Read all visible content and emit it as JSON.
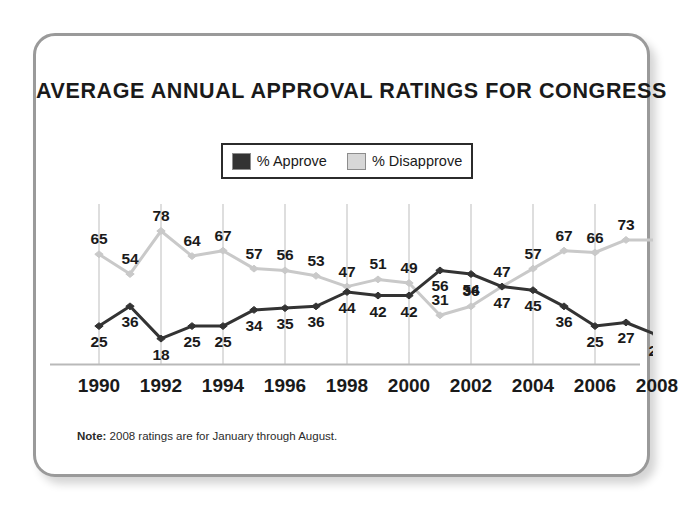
{
  "title": "AVERAGE ANNUAL APPROVAL RATINGS FOR CONGRESS",
  "legend": {
    "approve_label": "% Approve",
    "disapprove_label": "% Disapprove",
    "approve_color": "#333333",
    "disapprove_color": "#c9c9c9"
  },
  "note": {
    "prefix": "Note:",
    "text": " 2008 ratings are for January through August."
  },
  "chart_data": {
    "type": "line",
    "title": "AVERAGE ANNUAL APPROVAL RATINGS FOR CONGRESS",
    "xlabel": "",
    "ylabel": "",
    "ylim": [
      10,
      85
    ],
    "grid": "vertical-only",
    "legend_position": "top-center",
    "x": [
      1990,
      1991,
      1992,
      1993,
      1994,
      1995,
      1996,
      1997,
      1998,
      1999,
      2000,
      2001,
      2002,
      2003,
      2004,
      2005,
      2006,
      2007,
      2008
    ],
    "tick_labels": [
      "1990",
      "1992",
      "1994",
      "1996",
      "1998",
      "2000",
      "2002",
      "2004",
      "2006",
      "2008"
    ],
    "tick_values": [
      1990,
      1992,
      1994,
      1996,
      1998,
      2000,
      2002,
      2004,
      2006,
      2008
    ],
    "series": [
      {
        "name": "% Approve",
        "color": "#333333",
        "values": [
          25,
          36,
          18,
          25,
          25,
          34,
          35,
          36,
          44,
          42,
          42,
          56,
          54,
          47,
          45,
          36,
          25,
          27,
          20
        ],
        "label_position": "below"
      },
      {
        "name": "% Disapprove",
        "color": "#c9c9c9",
        "values": [
          65,
          54,
          78,
          64,
          67,
          57,
          56,
          53,
          47,
          51,
          49,
          31,
          36,
          47,
          57,
          67,
          66,
          73,
          73
        ],
        "label_position": "above"
      }
    ],
    "approve_labels": [
      "25",
      "36",
      "18",
      "25",
      "25",
      "34",
      "35",
      "36",
      "44",
      "42",
      "42",
      "56",
      "54",
      "47",
      "45",
      "36",
      "25",
      "27",
      "20"
    ],
    "disapprove_labels": [
      "65",
      "54",
      "78",
      "64",
      "67",
      "57",
      "56",
      "53",
      "47",
      "51",
      "49",
      "31",
      "36",
      "47",
      "57",
      "67",
      "66",
      "73"
    ]
  }
}
